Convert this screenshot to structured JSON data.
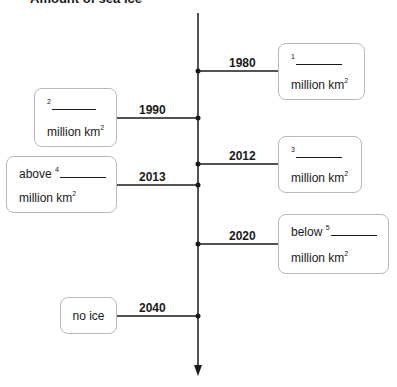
{
  "title": "Amount of sea ice",
  "unit_text": "million km",
  "unit_sup": "2",
  "timeline": [
    {
      "year": "1980",
      "side": "right",
      "prefix": "",
      "blank_no": "1"
    },
    {
      "year": "1990",
      "side": "left",
      "prefix": "",
      "blank_no": "2"
    },
    {
      "year": "2012",
      "side": "right",
      "prefix": "",
      "blank_no": "3"
    },
    {
      "year": "2013",
      "side": "left",
      "prefix": "above",
      "blank_no": "4"
    },
    {
      "year": "2020",
      "side": "right",
      "prefix": "below",
      "blank_no": "5"
    },
    {
      "year": "2040",
      "side": "left",
      "text": "no ice"
    }
  ]
}
